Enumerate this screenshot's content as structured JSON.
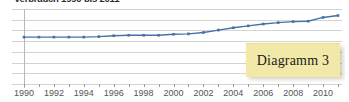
{
  "chart_data": {
    "type": "line",
    "title": "Verbrauch 1990 bis 2011",
    "xlabel": "",
    "ylabel": "",
    "grid": true,
    "legend": "none",
    "x": [
      1990,
      1991,
      1992,
      1993,
      1994,
      1995,
      1996,
      1997,
      1998,
      1999,
      2000,
      2001,
      2002,
      2003,
      2004,
      2005,
      2006,
      2007,
      2008,
      2009,
      2010,
      2011
    ],
    "tick_labels": [
      "1990",
      "1992",
      "1994",
      "1996",
      "1998",
      "2000",
      "2002",
      "2004",
      "2006",
      "2008",
      "2010"
    ],
    "xlim": [
      1990,
      2011
    ],
    "ylim": [
      0,
      8
    ],
    "gridline_count": 8,
    "series": [
      {
        "name": "Serie 1",
        "color": "#4472a8",
        "marker": "square",
        "values": [
          5.0,
          5.0,
          5.0,
          5.0,
          5.0,
          5.05,
          5.15,
          5.2,
          5.2,
          5.2,
          5.3,
          5.35,
          5.5,
          5.75,
          6.0,
          6.2,
          6.4,
          6.55,
          6.65,
          6.7,
          7.1,
          7.3
        ]
      }
    ]
  },
  "callout": {
    "label": "Diagramm 3",
    "background": "#f2e8a8",
    "text_color": "#1a1a1a"
  },
  "colors": {
    "series_blue": "#4472a8",
    "gridline": "#d3d3d3",
    "axis": "#b9b9b9",
    "tick_label": "#555555"
  }
}
